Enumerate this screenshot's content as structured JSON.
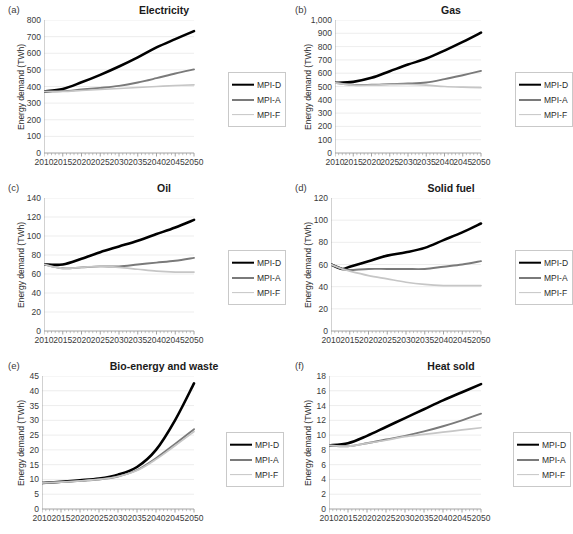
{
  "figure": {
    "ylabel": "Energy demand (TWh)",
    "series_names": [
      "MPI-D",
      "MPI-A",
      "MPI-F"
    ],
    "series_colors": [
      "#000000",
      "#7a7a7a",
      "#c6c6c6"
    ],
    "xticks": [
      "2010",
      "2015",
      "2020",
      "2025",
      "2030",
      "2035",
      "2040",
      "2045",
      "2050"
    ]
  },
  "chart_data": [
    {
      "type": "line",
      "panel": "(a)",
      "title": "Electricity",
      "xlabel": "",
      "ylabel": "Energy demand (TWh)",
      "xlim": [
        2010,
        2050
      ],
      "ylim": [
        0,
        800
      ],
      "yticks": [
        0,
        100,
        200,
        300,
        400,
        500,
        600,
        700,
        800
      ],
      "ytick_labels": [
        "0",
        "100",
        "200",
        "300",
        "400",
        "500",
        "600",
        "700",
        "800"
      ],
      "xticks": [
        2010,
        2015,
        2020,
        2025,
        2030,
        2035,
        2040,
        2045,
        2050
      ],
      "grid": "horizontal",
      "legend_position": "right-middle",
      "x": [
        2010,
        2015,
        2020,
        2025,
        2030,
        2035,
        2040,
        2045,
        2050
      ],
      "series": [
        {
          "name": "MPI-D",
          "values": [
            370,
            385,
            425,
            470,
            520,
            575,
            635,
            685,
            733
          ]
        },
        {
          "name": "MPI-A",
          "values": [
            370,
            372,
            382,
            392,
            404,
            424,
            450,
            478,
            503
          ]
        },
        {
          "name": "MPI-F",
          "values": [
            370,
            370,
            376,
            382,
            388,
            394,
            400,
            406,
            410
          ]
        }
      ]
    },
    {
      "type": "line",
      "panel": "(b)",
      "title": "Gas",
      "xlabel": "",
      "ylabel": "Energy demand (TWh)",
      "xlim": [
        2010,
        2050
      ],
      "ylim": [
        0,
        1000
      ],
      "yticks": [
        0,
        100,
        200,
        300,
        400,
        500,
        600,
        700,
        800,
        900,
        1000
      ],
      "ytick_labels": [
        "0",
        "100",
        "200",
        "300",
        "400",
        "500",
        "600",
        "700",
        "800",
        "900",
        "1,000"
      ],
      "xticks": [
        2010,
        2015,
        2020,
        2025,
        2030,
        2035,
        2040,
        2045,
        2050
      ],
      "grid": "horizontal",
      "legend_position": "right-middle",
      "x": [
        2010,
        2015,
        2020,
        2025,
        2030,
        2035,
        2040,
        2045,
        2050
      ],
      "series": [
        {
          "name": "MPI-D",
          "values": [
            528,
            535,
            565,
            615,
            665,
            710,
            770,
            835,
            905
          ]
        },
        {
          "name": "MPI-A",
          "values": [
            528,
            512,
            513,
            518,
            522,
            530,
            555,
            585,
            617
          ]
        },
        {
          "name": "MPI-F",
          "values": [
            528,
            510,
            510,
            513,
            515,
            510,
            500,
            495,
            492
          ]
        }
      ]
    },
    {
      "type": "line",
      "panel": "(c)",
      "title": "Oil",
      "xlabel": "",
      "ylabel": "Energy demand (TWh)",
      "xlim": [
        2010,
        2050
      ],
      "ylim": [
        0,
        140
      ],
      "yticks": [
        0,
        20,
        40,
        60,
        80,
        100,
        120,
        140
      ],
      "ytick_labels": [
        "0",
        "20",
        "40",
        "60",
        "80",
        "100",
        "120",
        "140"
      ],
      "xticks": [
        2010,
        2015,
        2020,
        2025,
        2030,
        2035,
        2040,
        2045,
        2050
      ],
      "grid": "horizontal",
      "legend_position": "right-middle",
      "x": [
        2010,
        2015,
        2020,
        2025,
        2030,
        2035,
        2040,
        2045,
        2050
      ],
      "series": [
        {
          "name": "MPI-D",
          "values": [
            70,
            70,
            76,
            83,
            89,
            95,
            102,
            109,
            117
          ]
        },
        {
          "name": "MPI-A",
          "values": [
            70,
            66,
            67,
            68,
            68,
            70,
            72,
            74,
            77
          ]
        },
        {
          "name": "MPI-F",
          "values": [
            70,
            66,
            67,
            68,
            67,
            65,
            63,
            62,
            62
          ]
        }
      ]
    },
    {
      "type": "line",
      "panel": "(d)",
      "title": "Solid fuel",
      "xlabel": "",
      "ylabel": "Energy demand (TWh)",
      "xlim": [
        2010,
        2050
      ],
      "ylim": [
        0,
        120
      ],
      "yticks": [
        0,
        20,
        40,
        60,
        80,
        100,
        120
      ],
      "ytick_labels": [
        "0",
        "20",
        "40",
        "60",
        "80",
        "100",
        "120"
      ],
      "xticks": [
        2010,
        2015,
        2020,
        2025,
        2030,
        2035,
        2040,
        2045,
        2050
      ],
      "grid": "horizontal",
      "legend_position": "right-middle",
      "x": [
        2010,
        2013,
        2015,
        2020,
        2025,
        2030,
        2035,
        2040,
        2045,
        2050
      ],
      "series": [
        {
          "name": "MPI-D",
          "values": [
            60,
            56,
            58,
            63,
            68,
            71,
            75,
            82,
            89,
            97
          ]
        },
        {
          "name": "MPI-A",
          "values": [
            60,
            56,
            55,
            56,
            56,
            56,
            56,
            58,
            60,
            63
          ]
        },
        {
          "name": "MPI-F",
          "values": [
            60,
            56,
            54,
            50,
            47,
            44,
            42,
            41,
            41,
            41
          ]
        }
      ]
    },
    {
      "type": "line",
      "panel": "(e)",
      "title": "Bio-energy and waste",
      "xlabel": "",
      "ylabel": "Energy demand (TWh)",
      "xlim": [
        2010,
        2050
      ],
      "ylim": [
        0,
        45
      ],
      "yticks": [
        0,
        5,
        10,
        15,
        20,
        25,
        30,
        35,
        40,
        45
      ],
      "ytick_labels": [
        "0",
        "5",
        "10",
        "15",
        "20",
        "25",
        "30",
        "35",
        "40",
        "45"
      ],
      "xticks": [
        2010,
        2015,
        2020,
        2025,
        2030,
        2035,
        2040,
        2045,
        2050
      ],
      "grid": "horizontal",
      "legend_position": "right-middle",
      "x": [
        2010,
        2015,
        2020,
        2025,
        2030,
        2035,
        2040,
        2045,
        2050
      ],
      "series": [
        {
          "name": "MPI-D",
          "values": [
            8.8,
            9.2,
            9.7,
            10.3,
            11.6,
            14.2,
            20.0,
            30.0,
            42.5
          ]
        },
        {
          "name": "MPI-A",
          "values": [
            8.8,
            9.1,
            9.5,
            10.0,
            11.0,
            13.2,
            17.2,
            22.0,
            27.0
          ]
        },
        {
          "name": "MPI-F",
          "values": [
            8.8,
            9.1,
            9.5,
            10.0,
            11.0,
            13.0,
            16.8,
            21.4,
            26.2
          ]
        }
      ]
    },
    {
      "type": "line",
      "panel": "(f)",
      "title": "Heat sold",
      "xlabel": "",
      "ylabel": "Energy demand (TWh)",
      "xlim": [
        2010,
        2050
      ],
      "ylim": [
        0,
        18
      ],
      "yticks": [
        0,
        2,
        4,
        6,
        8,
        10,
        12,
        14,
        16,
        18
      ],
      "ytick_labels": [
        "0",
        "2",
        "4",
        "6",
        "8",
        "10",
        "12",
        "14",
        "16",
        "18"
      ],
      "xticks": [
        2010,
        2015,
        2020,
        2025,
        2030,
        2035,
        2040,
        2045,
        2050
      ],
      "grid": "horizontal",
      "legend_position": "right-middle",
      "x": [
        2010,
        2015,
        2020,
        2025,
        2030,
        2035,
        2040,
        2045,
        2050
      ],
      "series": [
        {
          "name": "MPI-D",
          "values": [
            8.6,
            8.9,
            9.9,
            11.1,
            12.3,
            13.5,
            14.7,
            15.8,
            16.9
          ]
        },
        {
          "name": "MPI-A",
          "values": [
            8.6,
            8.5,
            8.9,
            9.4,
            9.9,
            10.5,
            11.2,
            12.0,
            12.9
          ]
        },
        {
          "name": "MPI-F",
          "values": [
            8.6,
            8.5,
            8.9,
            9.3,
            9.8,
            10.1,
            10.4,
            10.7,
            11.0
          ]
        }
      ]
    }
  ]
}
